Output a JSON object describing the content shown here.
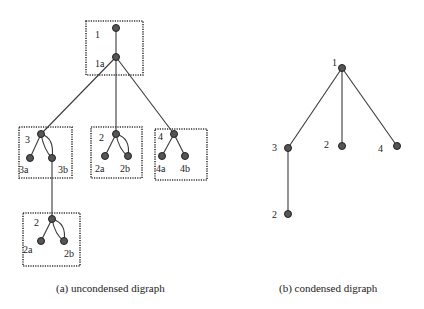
{
  "figure": {
    "panels": [
      {
        "id": "a",
        "caption": "(a) uncondensed digraph",
        "boxes": [
          {
            "name": "box-1",
            "label": "1",
            "x": 86,
            "y": 21,
            "w": 57,
            "h": 54
          },
          {
            "name": "box-3",
            "label": "3",
            "x": 19,
            "y": 127,
            "w": 53,
            "h": 51
          },
          {
            "name": "box-2-mid",
            "label": "2",
            "x": 91,
            "y": 127,
            "w": 51,
            "h": 51
          },
          {
            "name": "box-4",
            "label": "4",
            "x": 155,
            "y": 129,
            "w": 52,
            "h": 51
          },
          {
            "name": "box-2-low",
            "label": "2",
            "x": 23,
            "y": 213,
            "w": 57,
            "h": 53
          }
        ],
        "labels": {
          "n1": "1",
          "n1a": "1a",
          "n3": "3",
          "n3a": "3a",
          "n3b": "3b",
          "n2": "2",
          "n2a": "2a",
          "n2b": "2b",
          "n4": "4",
          "n4a": "4a",
          "n4b": "4b",
          "m2": "2",
          "m2a": "2a",
          "m2b": "2b"
        }
      },
      {
        "id": "b",
        "caption": "(b) condensed digraph",
        "labels": {
          "c1": "1",
          "c3": "3",
          "c2": "2",
          "c4": "4",
          "c2low": "2"
        }
      }
    ]
  }
}
